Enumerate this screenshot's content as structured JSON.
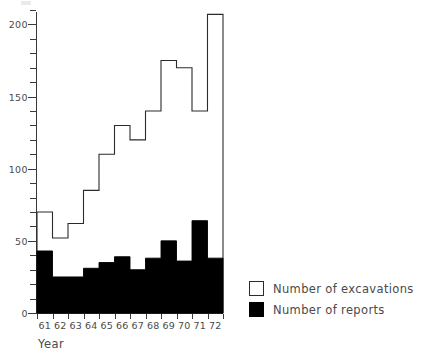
{
  "chart_data": {
    "type": "bar",
    "title": "",
    "xlabel": "Year",
    "ylabel": "",
    "categories": [
      "61",
      "62",
      "63",
      "64",
      "65",
      "66",
      "67",
      "68",
      "69",
      "70",
      "71",
      "72"
    ],
    "series": [
      {
        "name": "Number of excavations",
        "style": "outline",
        "color": "#ffffff",
        "edge_color": "#2b2b2b",
        "values": [
          70,
          52,
          62,
          85,
          110,
          130,
          120,
          140,
          175,
          170,
          140,
          207
        ]
      },
      {
        "name": "Number of reports",
        "style": "filled",
        "color": "#000000",
        "edge_color": "#000000",
        "values": [
          43,
          25,
          25,
          31,
          35,
          39,
          30,
          38,
          50,
          36,
          64,
          38
        ]
      }
    ],
    "ylim": [
      0,
      210
    ],
    "yticks_major": [
      0,
      50,
      100,
      150,
      200
    ],
    "ytick_labels": [
      "0",
      "50",
      "100",
      "150",
      "200"
    ],
    "ytick_minor_step": 10,
    "xlim_labels": [
      "61",
      "72"
    ],
    "grid": false,
    "legend_position": "right",
    "legend": [
      {
        "label": "Number of excavations",
        "swatch": "open-square"
      },
      {
        "label": "Number of reports",
        "swatch": "filled-square"
      }
    ]
  },
  "axis": {
    "x_title": "Year"
  },
  "colors": {
    "axis": "#3a3a3a",
    "text": "#4a4a4a",
    "excavations": "#ffffff",
    "reports": "#000000",
    "outline": "#2b2b2b"
  }
}
